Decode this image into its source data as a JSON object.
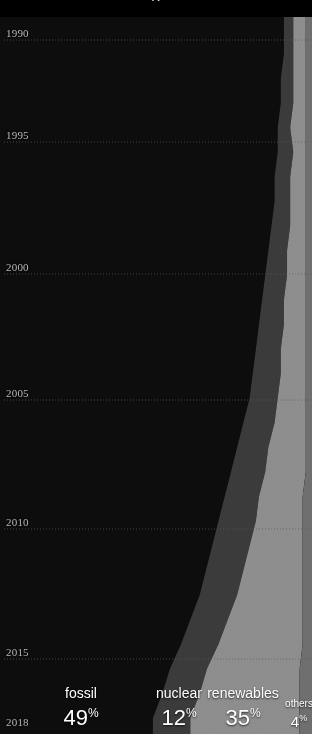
{
  "chart_data": {
    "type": "area",
    "title": "",
    "subtitle": "",
    "xlabel": "",
    "ylabel": "",
    "orientation": "horizontal-stack-time-down",
    "stacked": true,
    "normalized": true,
    "grid": true,
    "grid_style": "dotted",
    "legend_position": "bottom",
    "xlim": [
      0,
      100
    ],
    "ylim": [
      1990,
      2018
    ],
    "x_unit": "percent",
    "y_tick_labels": [
      "1990",
      "1995",
      "2000",
      "2005",
      "2010",
      "2015",
      "2018"
    ],
    "y_ticks": [
      1990,
      1995,
      2000,
      2005,
      2010,
      2015,
      2018
    ],
    "series": [
      {
        "name": "fossil",
        "color": "#0d0d0d",
        "end_value": 49,
        "end_label": "49",
        "unit": "%",
        "values": [
          91,
          91,
          90,
          90,
          89,
          89,
          88,
          88,
          87,
          86,
          85,
          84,
          83,
          82,
          81,
          80,
          78,
          76,
          74,
          72,
          70,
          68,
          66,
          64,
          61,
          58,
          55,
          52,
          49
        ]
      },
      {
        "name": "nuclear",
        "color": "#3b3b3b",
        "end_value": 12,
        "end_label": "12",
        "unit": "%",
        "values": [
          3,
          3,
          4,
          4,
          4,
          5,
          5,
          5,
          6,
          6,
          7,
          7,
          8,
          8,
          9,
          9,
          10,
          10,
          11,
          11,
          12,
          12,
          12,
          12,
          12,
          12,
          12,
          12,
          12
        ]
      },
      {
        "name": "renewables",
        "color": "#8e8e8e",
        "end_value": 35,
        "end_label": "35",
        "unit": "%",
        "values": [
          4,
          4,
          4,
          4,
          5,
          4,
          5,
          5,
          5,
          6,
          6,
          7,
          7,
          8,
          8,
          9,
          10,
          12,
          13,
          14,
          15,
          17,
          19,
          21,
          24,
          27,
          30,
          32,
          35
        ]
      },
      {
        "name": "others",
        "color": "#6f6f6f",
        "end_value": 4,
        "end_label": "4",
        "unit": "%",
        "values": [
          2,
          2,
          2,
          2,
          2,
          2,
          2,
          2,
          2,
          2,
          2,
          2,
          2,
          2,
          2,
          2,
          2,
          2,
          2,
          3,
          3,
          3,
          3,
          3,
          3,
          3,
          4,
          4,
          4
        ]
      }
    ]
  },
  "axis": {
    "year_labels": [
      {
        "text": "1990",
        "y": 29
      },
      {
        "text": "1995",
        "y": 131
      },
      {
        "text": "2000",
        "y": 263
      },
      {
        "text": "2005",
        "y": 389
      },
      {
        "text": "2010",
        "y": 518
      },
      {
        "text": "2015",
        "y": 648
      },
      {
        "text": "2018",
        "y": 718
      }
    ]
  },
  "legend": {
    "items": [
      {
        "name": "fossil",
        "value": "49",
        "pct": "%",
        "center": 81,
        "size": "large"
      },
      {
        "name": "nuclear",
        "value": "12",
        "pct": "%",
        "center": 179,
        "size": "large"
      },
      {
        "name": "renewables",
        "value": "35",
        "pct": "%",
        "center": 243,
        "size": "large"
      },
      {
        "name": "others",
        "value": "4",
        "pct": "%",
        "center": 299,
        "size": "small"
      }
    ]
  },
  "colors": {
    "background": "#000000",
    "fossil": "#0d0d0d",
    "nuclear": "#3b3b3b",
    "renewables": "#8e8e8e",
    "others": "#6f6f6f",
    "grid": "#5a5a5a",
    "tick_text": "#b9b9b9",
    "legend_text": "#ffffff"
  },
  "top_glyph": {
    "text": "g"
  }
}
